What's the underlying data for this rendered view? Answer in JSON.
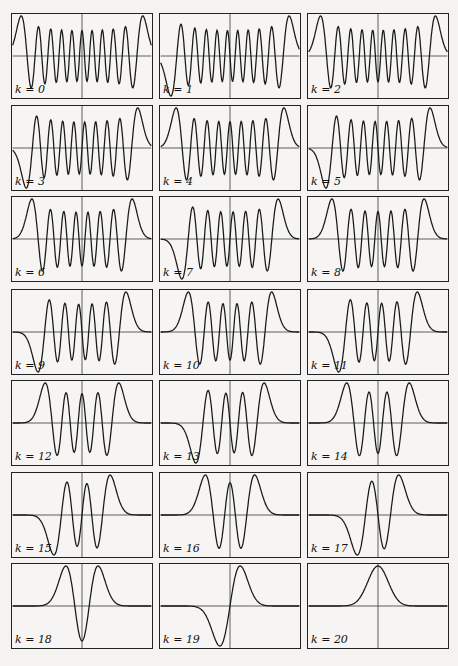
{
  "chart_data": {
    "type": "line",
    "title": "",
    "layout": {
      "rows": 7,
      "cols": 3,
      "axes": "x-axis horizontal line at y=0 and vertical line at x=0, no ticks",
      "grid": false
    },
    "panels": [
      {
        "label": "k = 0",
        "k": 0
      },
      {
        "label": "k = 1",
        "k": 1
      },
      {
        "label": "k = 2",
        "k": 2
      },
      {
        "label": "k = 3",
        "k": 3
      },
      {
        "label": "k = 4",
        "k": 4
      },
      {
        "label": "k = 5",
        "k": 5
      },
      {
        "label": "k = 6",
        "k": 6
      },
      {
        "label": "k = 7",
        "k": 7
      },
      {
        "label": "k = 8",
        "k": 8
      },
      {
        "label": "k = 9",
        "k": 9
      },
      {
        "label": "k = 10",
        "k": 10
      },
      {
        "label": "k = 11",
        "k": 11
      },
      {
        "label": "k = 12",
        "k": 12
      },
      {
        "label": "k = 13",
        "k": 13
      },
      {
        "label": "k = 14",
        "k": 14
      },
      {
        "label": "k = 15",
        "k": 15
      },
      {
        "label": "k = 16",
        "k": 16
      },
      {
        "label": "k = 17",
        "k": 17
      },
      {
        "label": "k = 18",
        "k": 18
      },
      {
        "label": "k = 19",
        "k": 19
      },
      {
        "label": "k = 20",
        "k": 20
      }
    ]
  },
  "colors": {
    "curve": "#1a1a1a",
    "axis": "#333333",
    "frame": "#222222"
  }
}
